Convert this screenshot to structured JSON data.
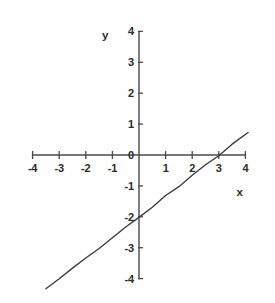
{
  "chart_data": {
    "type": "line",
    "title": "",
    "subtitle": "",
    "xlabel": "x",
    "ylabel": "y",
    "xlim": [
      -4,
      4
    ],
    "ylim": [
      -4,
      4
    ],
    "grid": false,
    "legend": null,
    "x_ticks": [
      -4,
      -3,
      -2,
      -1,
      0,
      1,
      2,
      3,
      4
    ],
    "y_ticks": [
      -4,
      -3,
      -2,
      -1,
      0,
      1,
      2,
      3,
      4
    ],
    "x_tick_labels": [
      "-4",
      "-3",
      "-2",
      "-1",
      "0",
      "1",
      "2",
      "3",
      "4"
    ],
    "y_tick_labels": [
      "-4",
      "-3",
      "-2",
      "-1",
      "0",
      "1",
      "2",
      "3",
      "4"
    ],
    "series": [
      {
        "name": "line",
        "equation": "y = (2/3)x - 2",
        "slope": 0.6667,
        "y_intercept": -2,
        "x_intercept": 3,
        "color": "#3a3a3a",
        "x": [
          -3.5,
          -3,
          -2.5,
          -2,
          -1.5,
          -1,
          -0.5,
          0,
          0.5,
          1,
          1.5,
          2,
          2.5,
          3,
          3.5,
          4.1
        ],
        "values": [
          -4.33,
          -4,
          -3.67,
          -3.33,
          -3,
          -2.67,
          -2.33,
          -2,
          -1.67,
          -1.33,
          -1,
          -0.67,
          -0.33,
          0,
          0.33,
          0.73
        ]
      }
    ]
  },
  "axes": {
    "x_axis_label": "x",
    "y_axis_label": "y",
    "zero_label": "0"
  },
  "colors": {
    "background": "#fefefe",
    "axis": "#4a4a4a",
    "line": "#3a3a3a",
    "text": "#2b2b2b"
  },
  "x_tick_labels": [
    {
      "value": -4,
      "text": "-4"
    },
    {
      "value": -3,
      "text": "-3"
    },
    {
      "value": -2,
      "text": "-2"
    },
    {
      "value": -1,
      "text": "-1"
    },
    {
      "value": 1,
      "text": "1"
    },
    {
      "value": 2,
      "text": "2"
    },
    {
      "value": 3,
      "text": "3"
    },
    {
      "value": 4,
      "text": "4"
    }
  ],
  "y_tick_labels": [
    {
      "value": 4,
      "text": "4"
    },
    {
      "value": 3,
      "text": "3"
    },
    {
      "value": 2,
      "text": "2"
    },
    {
      "value": 1,
      "text": "1"
    },
    {
      "value": 0,
      "text": "0"
    },
    {
      "value": -1,
      "text": "-1"
    },
    {
      "value": -2,
      "text": "-2"
    },
    {
      "value": -3,
      "text": "-3"
    },
    {
      "value": -4,
      "text": "-4"
    }
  ]
}
